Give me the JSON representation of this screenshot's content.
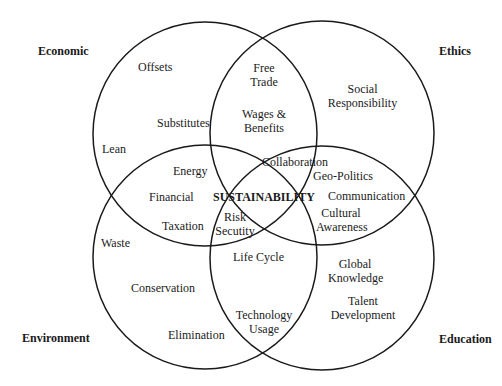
{
  "diagram": {
    "type": "venn",
    "center_label": "SUSTAINABILITY",
    "stroke_color": "#1a1a1a",
    "background": "#ffffff",
    "sets": [
      {
        "name": "Economic",
        "position": "top-left",
        "circle": {
          "cx": 205,
          "cy": 134,
          "r": 112
        }
      },
      {
        "name": "Ethics",
        "position": "top-right",
        "circle": {
          "cx": 322,
          "cy": 133,
          "r": 112
        }
      },
      {
        "name": "Environment",
        "position": "bottom-left",
        "circle": {
          "cx": 205,
          "cy": 257,
          "r": 112
        }
      },
      {
        "name": "Education",
        "position": "bottom-right",
        "circle": {
          "cx": 322,
          "cy": 258,
          "r": 112
        }
      }
    ],
    "corners": {
      "economic": "Economic",
      "ethics": "Ethics",
      "environment": "Environment",
      "education": "Education"
    },
    "items": {
      "offsets": "Offsets",
      "free_trade": [
        "Free",
        "Trade"
      ],
      "social_responsibility": [
        "Social",
        "Responsibility"
      ],
      "substitutes": "Substitutes",
      "wages_benefits": [
        "Wages &",
        "Benefits"
      ],
      "lean": "Lean",
      "energy": "Energy",
      "collaboration": "Collaboration",
      "geo_politics": "Geo-Politics",
      "financial": "Financial",
      "communication": "Communication",
      "taxation": "Taxation",
      "risk_security": [
        "Risk",
        "Secutity"
      ],
      "cultural_awareness": [
        "Cultural",
        "Awareness"
      ],
      "waste": "Waste",
      "life_cycle": "Life Cycle",
      "global_knowledge": [
        "Global",
        "Knowledge"
      ],
      "conservation": "Conservation",
      "talent_development": [
        "Talent",
        "Development"
      ],
      "elimination": "Elimination",
      "technology_usage": [
        "Technology",
        "Usage"
      ]
    }
  }
}
